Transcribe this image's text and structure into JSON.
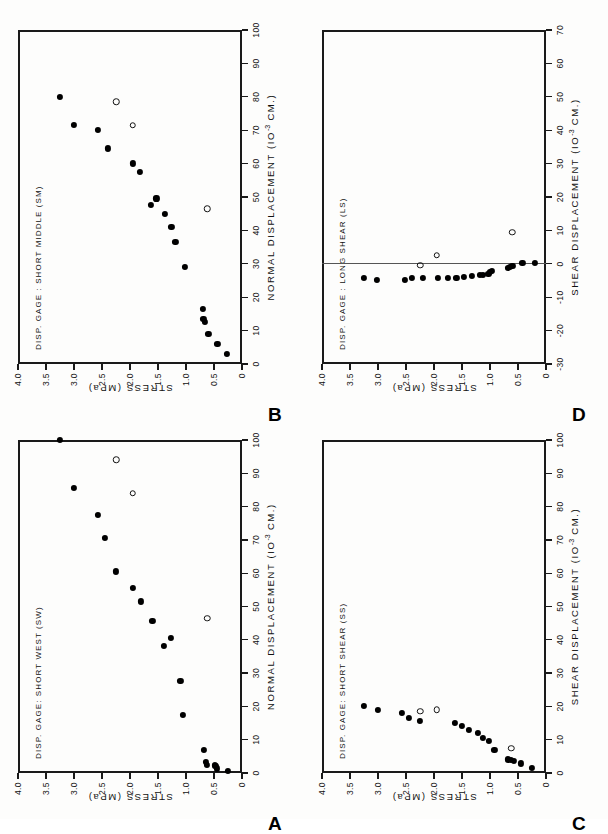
{
  "figure": {
    "background_color": "#fdfdfc",
    "ink_color": "#111111",
    "orientation_note": "page printed sideways",
    "panels_order": [
      "B",
      "D",
      "A",
      "C"
    ]
  },
  "axis_common": {
    "y_title": "STRESS  (MPa)",
    "y_ticks": [
      "4.0",
      "3.5",
      "3.0",
      "2.5",
      "2.0",
      "1.5",
      "1.0",
      "0.5",
      "0"
    ],
    "y_values": [
      4.0,
      3.5,
      3.0,
      2.5,
      2.0,
      1.5,
      1.0,
      0.5,
      0
    ],
    "y_min": 0,
    "y_max": 4.0,
    "units_exponent": "-3",
    "units_tail": " CM.)",
    "units_head": "(IO"
  },
  "panels": [
    {
      "letter": "B",
      "gage_label": "DISP. GAGE : SHORT MIDDLE (SM)",
      "x_title": "NORMAL  DISPLACEMENT",
      "x_ticks": [
        "0",
        "10",
        "20",
        "30",
        "40",
        "50",
        "60",
        "70",
        "80",
        "90",
        "100"
      ],
      "x_values": [
        0,
        10,
        20,
        30,
        40,
        50,
        60,
        70,
        80,
        90,
        100
      ],
      "x_min": 0,
      "x_max": 100,
      "has_refline": false,
      "refline_x": null,
      "chart_data": {
        "type": "scatter",
        "title": "DISP. GAGE : SHORT MIDDLE (SM)",
        "xlabel": "NORMAL DISPLACEMENT (10^-3 CM.)",
        "ylabel": "STRESS (MPa)",
        "xlim": [
          0,
          100
        ],
        "ylim": [
          0,
          4.0
        ],
        "grid": false,
        "legend": null,
        "series": [
          {
            "name": "loading (filled circles)",
            "marker": "filled-circle",
            "points": [
              [
                3.0,
                0.27
              ],
              [
                6.0,
                0.44
              ],
              [
                9.0,
                0.6
              ],
              [
                12.5,
                0.66
              ],
              [
                13.5,
                0.69
              ],
              [
                16.5,
                0.7
              ],
              [
                29.0,
                1.02
              ],
              [
                36.5,
                1.19
              ],
              [
                41.0,
                1.26
              ],
              [
                45.0,
                1.38
              ],
              [
                49.5,
                1.53
              ],
              [
                47.5,
                1.63
              ],
              [
                57.5,
                1.82
              ],
              [
                60.0,
                1.95
              ],
              [
                64.5,
                2.4
              ],
              [
                70.0,
                2.58
              ],
              [
                71.5,
                3.0
              ],
              [
                80.0,
                3.25
              ]
            ]
          },
          {
            "name": "unloading (open circles)",
            "marker": "open-circle",
            "points": [
              [
                46.5,
                0.62
              ],
              [
                71.5,
                1.95
              ],
              [
                78.5,
                2.25
              ]
            ]
          }
        ]
      }
    },
    {
      "letter": "D",
      "gage_label": "DISP. GAGE : LONG SHEAR (LS)",
      "x_title": "SHEAR  DISPLACEMENT",
      "x_ticks": [
        "-30",
        "-20",
        "-10",
        "0",
        "10",
        "20",
        "30",
        "40",
        "50",
        "60",
        "70"
      ],
      "x_values": [
        -30,
        -20,
        -10,
        0,
        10,
        20,
        30,
        40,
        50,
        60,
        70
      ],
      "x_min": -30,
      "x_max": 70,
      "has_refline": true,
      "refline_x": 0,
      "chart_data": {
        "type": "scatter",
        "title": "DISP. GAGE : LONG SHEAR (LS)",
        "xlabel": "SHEAR DISPLACEMENT (10^-3 CM.)",
        "ylabel": "STRESS (MPa)",
        "xlim": [
          -30,
          70
        ],
        "ylim": [
          0,
          4.0
        ],
        "grid": false,
        "legend": null,
        "series": [
          {
            "name": "loading (filled circles)",
            "marker": "filled-circle",
            "points": [
              [
                0.3,
                0.2
              ],
              [
                0.2,
                0.42
              ],
              [
                -0.8,
                0.6
              ],
              [
                -1.0,
                0.65
              ],
              [
                -1.3,
                0.68
              ],
              [
                -2.2,
                0.97
              ],
              [
                -2.6,
                1.0
              ],
              [
                -3.0,
                1.03
              ],
              [
                -3.3,
                1.12
              ],
              [
                -3.4,
                1.18
              ],
              [
                -3.8,
                1.32
              ],
              [
                -4.0,
                1.46
              ],
              [
                -4.2,
                1.6
              ],
              [
                -4.3,
                1.75
              ],
              [
                -4.2,
                1.93
              ],
              [
                -4.4,
                2.2
              ],
              [
                -4.3,
                2.4
              ],
              [
                -4.8,
                2.52
              ],
              [
                -5.0,
                3.02
              ],
              [
                -4.2,
                3.25
              ]
            ]
          },
          {
            "name": "unloading (open circles)",
            "marker": "open-circle",
            "points": [
              [
                9.5,
                0.6
              ],
              [
                2.5,
                1.95
              ],
              [
                -0.5,
                2.25
              ]
            ]
          }
        ]
      }
    },
    {
      "letter": "A",
      "gage_label": "DISP. GAGE: SHORT WEST (SW)",
      "x_title": "NORMAL  DISPLACEMENT",
      "x_ticks": [
        "0",
        "10",
        "20",
        "30",
        "40",
        "50",
        "60",
        "70",
        "80",
        "90",
        "100"
      ],
      "x_values": [
        0,
        10,
        20,
        30,
        40,
        50,
        60,
        70,
        80,
        90,
        100
      ],
      "x_min": 0,
      "x_max": 100,
      "has_refline": false,
      "refline_x": null,
      "chart_data": {
        "type": "scatter",
        "title": "DISP. GAGE: SHORT WEST (SW)",
        "xlabel": "NORMAL DISPLACEMENT (10^-3 CM.)",
        "ylabel": "STRESS (MPa)",
        "xlim": [
          0,
          100
        ],
        "ylim": [
          0,
          4.0
        ],
        "grid": false,
        "legend": null,
        "series": [
          {
            "name": "loading (filled circles)",
            "marker": "filled-circle",
            "points": [
              [
                0.6,
                0.25
              ],
              [
                1.3,
                0.45
              ],
              [
                2.0,
                0.47
              ],
              [
                2.2,
                0.49
              ],
              [
                2.4,
                0.62
              ],
              [
                3.2,
                0.65
              ],
              [
                6.8,
                0.68
              ],
              [
                17.5,
                1.05
              ],
              [
                27.5,
                1.1
              ],
              [
                38.0,
                1.4
              ],
              [
                40.5,
                1.27
              ],
              [
                45.5,
                1.6
              ],
              [
                51.5,
                1.8
              ],
              [
                55.5,
                1.95
              ],
              [
                60.5,
                2.25
              ],
              [
                70.5,
                2.45
              ],
              [
                77.5,
                2.58
              ],
              [
                85.5,
                3.0
              ],
              [
                100.0,
                3.25
              ]
            ]
          },
          {
            "name": "unloading (open circles)",
            "marker": "open-circle",
            "points": [
              [
                46.5,
                0.62
              ],
              [
                84.0,
                1.95
              ],
              [
                94.0,
                2.25
              ]
            ]
          }
        ]
      }
    },
    {
      "letter": "C",
      "gage_label": "DISP. GAGE: SHORT SHEAR (SS)",
      "x_title": "SHEAR  DISPLACEMENT",
      "x_ticks": [
        "0",
        "10",
        "20",
        "30",
        "40",
        "50",
        "60",
        "70",
        "80",
        "90",
        "100"
      ],
      "x_values": [
        0,
        10,
        20,
        30,
        40,
        50,
        60,
        70,
        80,
        90,
        100
      ],
      "x_min": 0,
      "x_max": 100,
      "has_refline": false,
      "refline_x": null,
      "chart_data": {
        "type": "scatter",
        "title": "DISP. GAGE: SHORT SHEAR (SS)",
        "xlabel": "SHEAR DISPLACEMENT (10^-3 CM.)",
        "ylabel": "STRESS (MPa)",
        "xlim": [
          0,
          100
        ],
        "ylim": [
          0,
          4.0
        ],
        "grid": false,
        "legend": null,
        "series": [
          {
            "name": "loading (filled circles)",
            "marker": "filled-circle",
            "points": [
              [
                1.5,
                0.25
              ],
              [
                2.8,
                0.45
              ],
              [
                3.5,
                0.58
              ],
              [
                3.8,
                0.62
              ],
              [
                4.0,
                0.68
              ],
              [
                7.0,
                0.92
              ],
              [
                9.5,
                1.02
              ],
              [
                10.5,
                1.12
              ],
              [
                12.0,
                1.22
              ],
              [
                13.0,
                1.38
              ],
              [
                14.0,
                1.5
              ],
              [
                15.0,
                1.62
              ],
              [
                15.5,
                2.25
              ],
              [
                16.5,
                2.45
              ],
              [
                18.0,
                2.58
              ],
              [
                19.0,
                3.0
              ],
              [
                20.0,
                3.25
              ]
            ]
          },
          {
            "name": "unloading (open circles)",
            "marker": "open-circle",
            "points": [
              [
                7.5,
                0.62
              ],
              [
                19.0,
                1.95
              ],
              [
                18.5,
                2.25
              ]
            ]
          }
        ]
      }
    }
  ]
}
